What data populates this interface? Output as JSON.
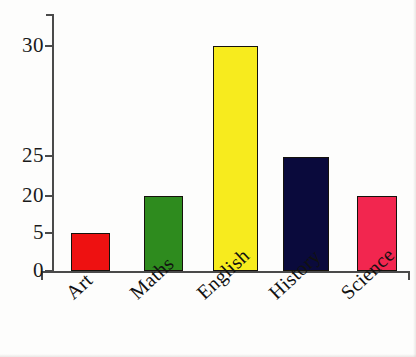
{
  "chart_data": {
    "type": "bar",
    "title": "",
    "subtitle": "",
    "xlabel": "",
    "ylabel": "",
    "categories": [
      "Art",
      "Maths",
      "English",
      "History",
      "Science"
    ],
    "values": [
      5,
      20,
      30,
      25,
      20
    ],
    "series": [
      {
        "name": "Subjects",
        "values": [
          5,
          20,
          30,
          25,
          20
        ]
      }
    ],
    "bar_colors": [
      "#ee1111",
      "#2e8b1e",
      "#f7eb1e",
      "#0a0a3c",
      "#f2264f"
    ],
    "bar_border_color": "#15120c",
    "y_tick_labels": [
      "0",
      "5",
      "20",
      "25",
      "30"
    ],
    "y_tick_values": [
      0,
      5,
      20,
      25,
      30
    ],
    "ylim": [
      0,
      30
    ],
    "grid": "off",
    "legend": "none",
    "axis_color": "#4a4a4a",
    "note": "y-axis tick spacing is irregular / non-linear as drawn"
  },
  "axis": {
    "y_ticks": [
      {
        "label": "30",
        "pixel_y": 46
      },
      {
        "label": "25",
        "pixel_y": 156
      },
      {
        "label": "20",
        "pixel_y": 196
      },
      {
        "label": "5",
        "pixel_y": 233
      },
      {
        "label": "0",
        "pixel_y": 271
      }
    ]
  },
  "bars": [
    {
      "category": "Art",
      "value": 5,
      "color": "#ee1111",
      "left": 71,
      "width": 39,
      "top": 233
    },
    {
      "category": "Maths",
      "value": 20,
      "color": "#2e8b1e",
      "left": 144,
      "width": 39,
      "top": 196
    },
    {
      "category": "English",
      "value": 30,
      "color": "#f7eb1e",
      "left": 213,
      "width": 45,
      "top": 46
    },
    {
      "category": "History",
      "value": 25,
      "color": "#0a0a3c",
      "left": 283,
      "width": 46,
      "top": 157
    },
    {
      "category": "Science",
      "value": 20,
      "color": "#f2264f",
      "left": 357,
      "width": 40,
      "top": 196
    }
  ],
  "x_labels": [
    {
      "text": "Art",
      "left": 62,
      "top": 288
    },
    {
      "text": "Maths",
      "left": 126,
      "top": 288
    },
    {
      "text": "English",
      "left": 193,
      "top": 288
    },
    {
      "text": "History",
      "left": 265,
      "top": 288
    },
    {
      "text": "Science",
      "left": 337,
      "top": 288
    }
  ]
}
